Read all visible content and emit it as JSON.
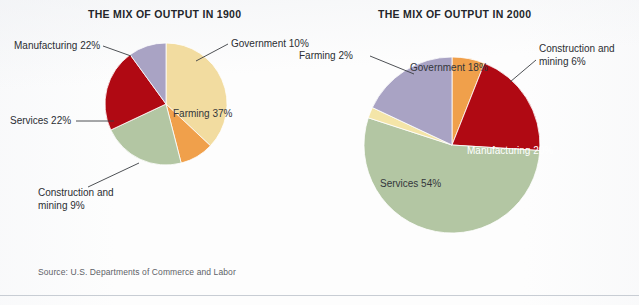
{
  "source_note": "Source: U.S. Departments of Commerce and Labor",
  "chart_data": [
    {
      "type": "pie",
      "title": "THE MIX OF OUTPUT IN 1900",
      "categories": [
        "Farming",
        "Construction and mining",
        "Services",
        "Manufacturing",
        "Government"
      ],
      "values": [
        37,
        9,
        22,
        22,
        10
      ],
      "unit": "%",
      "colors": [
        "#f2dca0",
        "#f0a04b",
        "#b3c6a3",
        "#b00913",
        "#a9a3c4"
      ],
      "labels": [
        "Farming 37%",
        "Construction and\nmining 9%",
        "Services 22%",
        "Manufacturing 22%",
        "Government 10%"
      ],
      "legend": "none",
      "start_angle_deg": 0,
      "direction": "clockwise"
    },
    {
      "type": "pie",
      "title": "THE MIX OF OUTPUT IN 2000",
      "categories": [
        "Construction and mining",
        "Manufacturing",
        "Services",
        "Farming",
        "Government"
      ],
      "values": [
        6,
        20,
        54,
        2,
        18
      ],
      "unit": "%",
      "colors": [
        "#f0a04b",
        "#b00913",
        "#b3c6a3",
        "#f4e5a8",
        "#a9a3c4"
      ],
      "labels": [
        "Construction and\nmining 6%",
        "Manufacturing 20%",
        "Services 54%",
        "Farming 2%",
        "Government 18%"
      ],
      "legend": "none",
      "start_angle_deg": 0,
      "direction": "clockwise"
    }
  ],
  "chart_1900": {
    "title": "THE MIX OF OUTPUT IN 1900",
    "labels": {
      "manufacturing": "Manufacturing 22%",
      "government": "Government 10%",
      "services": "Services 22%",
      "farming": "Farming 37%",
      "construction_line1": "Construction and",
      "construction_line2": "mining 9%"
    }
  },
  "chart_2000": {
    "title": "THE MIX OF OUTPUT IN 2000",
    "labels": {
      "farming": "Farming 2%",
      "government": "Government 18%",
      "construction_line1": "Construction and",
      "construction_line2": "mining 6%",
      "manufacturing": "Manufacturing 20%",
      "services": "Services 54%"
    }
  }
}
